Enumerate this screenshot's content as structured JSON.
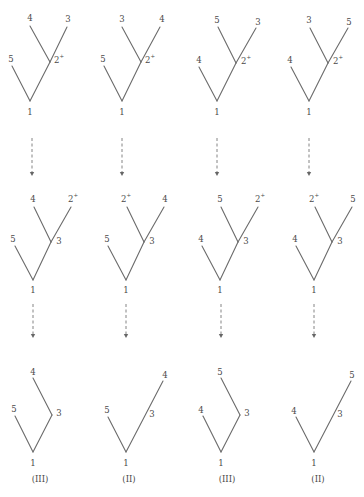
{
  "colors": {
    "edge": "#6b6b6b",
    "text": "#4a4a4a",
    "arrow": "#777777"
  },
  "rows": [
    {
      "name": "row-top",
      "trees": [
        {
          "nodes": [
            {
              "id": "1",
              "x": 30,
              "y": 101,
              "label": "1",
              "lx": 30,
              "ly": 112
            },
            {
              "id": "b",
              "x": 50,
              "y": 62,
              "label": "2",
              "sup": "+",
              "lx": 59,
              "ly": 60
            },
            {
              "id": "5",
              "x": 12,
              "y": 66,
              "label": "5",
              "lx": 11,
              "ly": 59
            },
            {
              "id": "4",
              "x": 30,
              "y": 26,
              "label": "4",
              "lx": 30,
              "ly": 18
            },
            {
              "id": "3",
              "x": 67,
              "y": 27,
              "label": "3",
              "lx": 68,
              "ly": 19
            }
          ],
          "edges": [
            [
              "1",
              "5"
            ],
            [
              "1",
              "b"
            ],
            [
              "b",
              "4"
            ],
            [
              "b",
              "3"
            ]
          ]
        },
        {
          "nodes": [
            {
              "id": "1",
              "x": 122,
              "y": 101,
              "label": "1",
              "lx": 122,
              "ly": 112
            },
            {
              "id": "b",
              "x": 141,
              "y": 62,
              "label": "2",
              "sup": "+",
              "lx": 150,
              "ly": 60
            },
            {
              "id": "5",
              "x": 104,
              "y": 66,
              "label": "5",
              "lx": 103,
              "ly": 59
            },
            {
              "id": "3",
              "x": 122,
              "y": 27,
              "label": "3",
              "lx": 122,
              "ly": 19
            },
            {
              "id": "4",
              "x": 160,
              "y": 27,
              "label": "4",
              "lx": 162,
              "ly": 19
            }
          ],
          "edges": [
            [
              "1",
              "5"
            ],
            [
              "1",
              "b"
            ],
            [
              "b",
              "3"
            ],
            [
              "b",
              "4"
            ]
          ]
        },
        {
          "nodes": [
            {
              "id": "1",
              "x": 217,
              "y": 101,
              "label": "1",
              "lx": 217,
              "ly": 112
            },
            {
              "id": "b",
              "x": 236,
              "y": 63,
              "label": "2",
              "sup": "+",
              "lx": 246,
              "ly": 61
            },
            {
              "id": "4",
              "x": 199,
              "y": 67,
              "label": "4",
              "lx": 199,
              "ly": 60
            },
            {
              "id": "5",
              "x": 218,
              "y": 27,
              "label": "5",
              "lx": 217,
              "ly": 20
            },
            {
              "id": "3",
              "x": 256,
              "y": 28,
              "label": "3",
              "lx": 258,
              "ly": 22
            }
          ],
          "edges": [
            [
              "1",
              "4"
            ],
            [
              "1",
              "b"
            ],
            [
              "b",
              "5"
            ],
            [
              "b",
              "3"
            ]
          ]
        },
        {
          "nodes": [
            {
              "id": "1",
              "x": 309,
              "y": 101,
              "label": "1",
              "lx": 309,
              "ly": 112
            },
            {
              "id": "b",
              "x": 328,
              "y": 63,
              "label": "2",
              "sup": "+",
              "lx": 338,
              "ly": 61
            },
            {
              "id": "4",
              "x": 291,
              "y": 67,
              "label": "4",
              "lx": 290,
              "ly": 60
            },
            {
              "id": "3",
              "x": 310,
              "y": 28,
              "label": "3",
              "lx": 309,
              "ly": 20
            },
            {
              "id": "5",
              "x": 348,
              "y": 28,
              "label": "5",
              "lx": 349,
              "ly": 22
            }
          ],
          "edges": [
            [
              "1",
              "4"
            ],
            [
              "1",
              "b"
            ],
            [
              "b",
              "3"
            ],
            [
              "b",
              "5"
            ]
          ]
        }
      ]
    },
    {
      "name": "row-middle",
      "trees": [
        {
          "nodes": [
            {
              "id": "1",
              "x": 33,
              "y": 280,
              "label": "1",
              "lx": 33,
              "ly": 290
            },
            {
              "id": "b",
              "x": 51,
              "y": 242,
              "label": "3",
              "lx": 59,
              "ly": 241
            },
            {
              "id": "5",
              "x": 15,
              "y": 246,
              "label": "5",
              "lx": 13,
              "ly": 239
            },
            {
              "id": "4",
              "x": 34,
              "y": 207,
              "label": "4",
              "lx": 33,
              "ly": 199
            },
            {
              "id": "2",
              "x": 71,
              "y": 207,
              "label": "2",
              "sup": "+",
              "lx": 73,
              "ly": 199
            }
          ],
          "edges": [
            [
              "1",
              "5"
            ],
            [
              "1",
              "b"
            ],
            [
              "b",
              "4"
            ],
            [
              "b",
              "2"
            ]
          ]
        },
        {
          "nodes": [
            {
              "id": "1",
              "x": 126,
              "y": 280,
              "label": "1",
              "lx": 126,
              "ly": 290
            },
            {
              "id": "b",
              "x": 144,
              "y": 242,
              "label": "3",
              "lx": 152,
              "ly": 241
            },
            {
              "id": "5",
              "x": 108,
              "y": 246,
              "label": "5",
              "lx": 107,
              "ly": 239
            },
            {
              "id": "2",
              "x": 127,
              "y": 207,
              "label": "2",
              "sup": "+",
              "lx": 126,
              "ly": 199
            },
            {
              "id": "4",
              "x": 164,
              "y": 207,
              "label": "4",
              "lx": 165,
              "ly": 199
            }
          ],
          "edges": [
            [
              "1",
              "5"
            ],
            [
              "1",
              "b"
            ],
            [
              "b",
              "2"
            ],
            [
              "b",
              "4"
            ]
          ]
        },
        {
          "nodes": [
            {
              "id": "1",
              "x": 220,
              "y": 280,
              "label": "1",
              "lx": 220,
              "ly": 290
            },
            {
              "id": "b",
              "x": 238,
              "y": 242,
              "label": "3",
              "lx": 246,
              "ly": 241
            },
            {
              "id": "4",
              "x": 202,
              "y": 246,
              "label": "4",
              "lx": 201,
              "ly": 239
            },
            {
              "id": "5",
              "x": 221,
              "y": 207,
              "label": "5",
              "lx": 220,
              "ly": 199
            },
            {
              "id": "2",
              "x": 258,
              "y": 207,
              "label": "2",
              "sup": "+",
              "lx": 260,
              "ly": 199
            }
          ],
          "edges": [
            [
              "1",
              "4"
            ],
            [
              "1",
              "b"
            ],
            [
              "b",
              "5"
            ],
            [
              "b",
              "2"
            ]
          ]
        },
        {
          "nodes": [
            {
              "id": "1",
              "x": 314,
              "y": 280,
              "label": "1",
              "lx": 314,
              "ly": 290
            },
            {
              "id": "b",
              "x": 332,
              "y": 242,
              "label": "3",
              "lx": 340,
              "ly": 241
            },
            {
              "id": "4",
              "x": 296,
              "y": 246,
              "label": "4",
              "lx": 295,
              "ly": 239
            },
            {
              "id": "2",
              "x": 315,
              "y": 207,
              "label": "2",
              "sup": "+",
              "lx": 314,
              "ly": 199
            },
            {
              "id": "5",
              "x": 352,
              "y": 207,
              "label": "5",
              "lx": 353,
              "ly": 199
            }
          ],
          "edges": [
            [
              "1",
              "4"
            ],
            [
              "1",
              "b"
            ],
            [
              "b",
              "2"
            ],
            [
              "b",
              "5"
            ]
          ]
        }
      ]
    },
    {
      "name": "row-bottom",
      "trees": [
        {
          "nodes": [
            {
              "id": "1",
              "x": 33,
              "y": 452,
              "label": "1",
              "lx": 33,
              "ly": 463
            },
            {
              "id": "3",
              "x": 52,
              "y": 415,
              "label": "3",
              "lx": 59,
              "ly": 413
            },
            {
              "id": "5",
              "x": 15,
              "y": 416,
              "label": "5",
              "lx": 14,
              "ly": 409
            },
            {
              "id": "4",
              "x": 33,
              "y": 378,
              "label": "4",
              "lx": 33,
              "ly": 372
            }
          ],
          "edges": [
            [
              "1",
              "5"
            ],
            [
              "1",
              "3"
            ],
            [
              "3",
              "4"
            ]
          ],
          "caption": "(III)"
        },
        {
          "nodes": [
            {
              "id": "1",
              "x": 126,
              "y": 452,
              "label": "1",
              "lx": 126,
              "ly": 463
            },
            {
              "id": "5",
              "x": 108,
              "y": 417,
              "label": "5",
              "lx": 107,
              "ly": 410
            },
            {
              "id": "4",
              "x": 163,
              "y": 381,
              "label": "4",
              "lx": 165,
              "ly": 375
            }
          ],
          "edges": [
            [
              "1",
              "5"
            ],
            [
              "1",
              "4"
            ]
          ],
          "midLabels": [
            {
              "label": "3",
              "lx": 152,
              "ly": 414
            }
          ],
          "caption": "(II)"
        },
        {
          "nodes": [
            {
              "id": "1",
              "x": 221,
              "y": 452,
              "label": "1",
              "lx": 221,
              "ly": 463
            },
            {
              "id": "3",
              "x": 240,
              "y": 415,
              "label": "3",
              "lx": 247,
              "ly": 413
            },
            {
              "id": "4",
              "x": 203,
              "y": 416,
              "label": "4",
              "lx": 201,
              "ly": 410
            },
            {
              "id": "5",
              "x": 221,
              "y": 378,
              "label": "5",
              "lx": 220,
              "ly": 372
            }
          ],
          "edges": [
            [
              "1",
              "4"
            ],
            [
              "1",
              "3"
            ],
            [
              "3",
              "5"
            ]
          ],
          "caption": "(III)"
        },
        {
          "nodes": [
            {
              "id": "1",
              "x": 314,
              "y": 452,
              "label": "1",
              "lx": 314,
              "ly": 463
            },
            {
              "id": "4",
              "x": 296,
              "y": 417,
              "label": "4",
              "lx": 294,
              "ly": 411
            },
            {
              "id": "5",
              "x": 351,
              "y": 381,
              "label": "5",
              "lx": 352,
              "ly": 375
            }
          ],
          "edges": [
            [
              "1",
              "4"
            ],
            [
              "1",
              "5"
            ]
          ],
          "midLabels": [
            {
              "label": "3",
              "lx": 340,
              "ly": 414
            }
          ],
          "caption": "(II)"
        }
      ]
    }
  ],
  "captions": [
    {
      "text": "(III)",
      "x": 40,
      "y": 479
    },
    {
      "text": "(II)",
      "x": 129,
      "y": 479
    },
    {
      "text": "(III)",
      "x": 227,
      "y": 479
    },
    {
      "text": "(II)",
      "x": 318,
      "y": 479
    }
  ],
  "arrows": [
    {
      "x": 32,
      "y1": 138,
      "y2": 176
    },
    {
      "x": 122,
      "y1": 138,
      "y2": 176
    },
    {
      "x": 217,
      "y1": 138,
      "y2": 176
    },
    {
      "x": 309,
      "y1": 138,
      "y2": 176
    },
    {
      "x": 33,
      "y1": 304,
      "y2": 338
    },
    {
      "x": 126,
      "y1": 304,
      "y2": 338
    },
    {
      "x": 221,
      "y1": 304,
      "y2": 338
    },
    {
      "x": 314,
      "y1": 304,
      "y2": 338
    }
  ]
}
